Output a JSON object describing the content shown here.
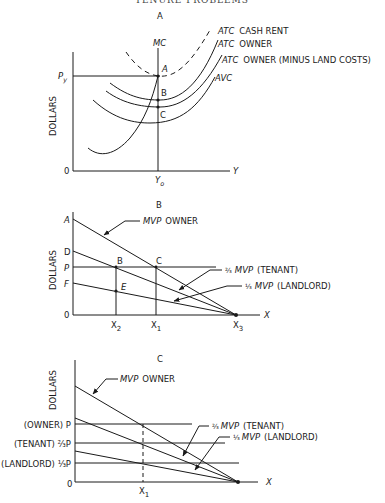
{
  "header": {
    "running_title": "TENURE PROBLEMS"
  },
  "panels": {
    "A": {
      "title": "A",
      "ylabel": "DOLLARS",
      "xlabel": "Y",
      "origin": "0",
      "price_label": "P",
      "price_sub": "y",
      "quantity_label": "Y",
      "quantity_sub": "o",
      "points": [
        "A",
        "B",
        "C"
      ],
      "curves": {
        "mc": "MC",
        "atc_cash_rent_it": "ATC",
        "atc_cash_rent": "CASH RENT",
        "atc_owner_it": "ATC",
        "atc_owner": "OWNER",
        "atc_owner_minus_it": "ATC",
        "atc_owner_minus": "OWNER (MINUS LAND COSTS)",
        "avc_it": "AVC"
      }
    },
    "B": {
      "title": "B",
      "ylabel": "DOLLARS",
      "xlabel": "X",
      "origin": "0",
      "y_ticks": [
        "A",
        "D",
        "P",
        "F"
      ],
      "points": [
        "B",
        "C",
        "E"
      ],
      "x_ticks": [
        {
          "base": "X",
          "sub": "2"
        },
        {
          "base": "X",
          "sub": "1"
        },
        {
          "base": "X",
          "sub": "3"
        }
      ],
      "curves": {
        "mvp_owner_it": "MVP",
        "mvp_owner": "OWNER",
        "tenant_frac": "⅔",
        "tenant_it": "MVP",
        "tenant": "(TENANT)",
        "landlord_frac": "⅓",
        "landlord_it": "MVP",
        "landlord": "(LANDLORD)"
      }
    },
    "C": {
      "title": "C",
      "ylabel": "DOLLARS",
      "xlabel": "X",
      "origin": "0",
      "y_ticks": [
        "(OWNER) P",
        "(TENANT) ⅔P",
        "(LANDLORD) ⅓P"
      ],
      "x_ticks": [
        {
          "base": "X",
          "sub": "1"
        }
      ],
      "curves": {
        "mvp_owner_it": "MVP",
        "mvp_owner": "OWNER",
        "tenant_frac": "⅔",
        "tenant_it": "MVP",
        "tenant": "(TENANT)",
        "landlord_frac": "⅓",
        "landlord_it": "MVP",
        "landlord": "(LANDLORD)"
      }
    }
  }
}
